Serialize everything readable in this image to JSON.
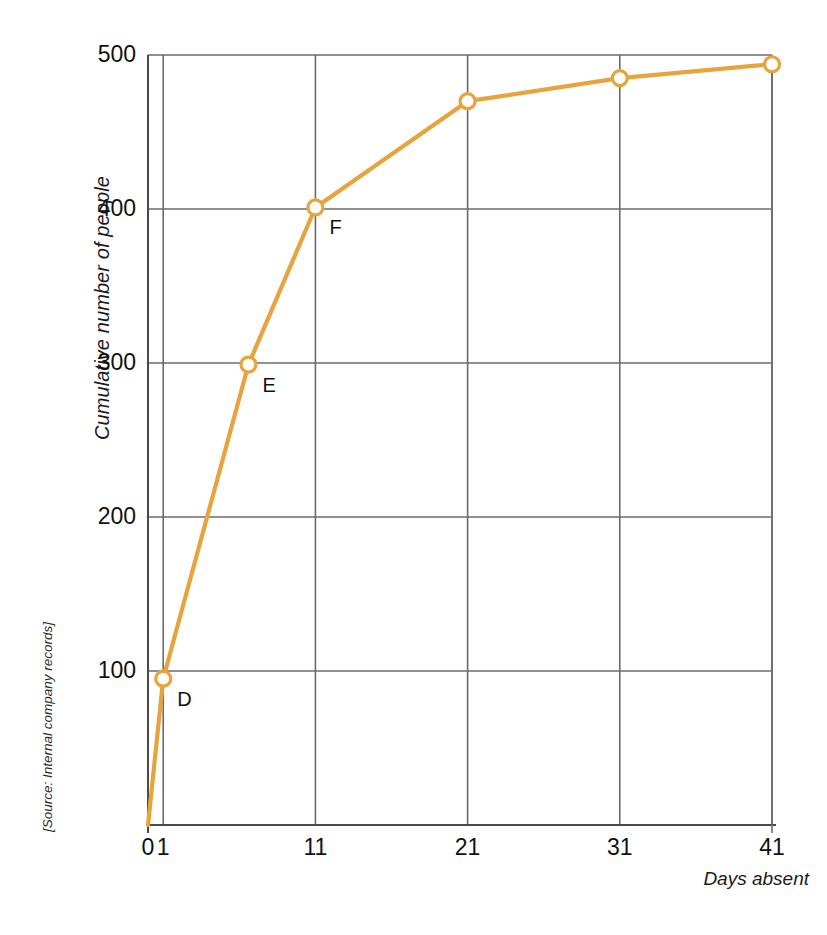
{
  "chart_data": {
    "type": "line",
    "title": "",
    "subtitle": "",
    "xlabel": "Days absent",
    "ylabel": "Cumulative number of people",
    "source_note": "[Source: Internal company records]",
    "xlim": [
      0,
      41
    ],
    "ylim": [
      0,
      500
    ],
    "x_ticks": [
      0,
      1,
      11,
      21,
      31,
      41
    ],
    "x_tick_labels": [
      "0",
      "1",
      "11",
      "21",
      "31",
      "41"
    ],
    "y_ticks": [
      0,
      100,
      200,
      300,
      400,
      500
    ],
    "y_tick_labels": [
      "",
      "100",
      "200",
      "300",
      "400",
      "500"
    ],
    "grid": "both",
    "grid_x_values": [
      0,
      1,
      11,
      21,
      31,
      41
    ],
    "grid_y_values": [
      100,
      200,
      300,
      400,
      500
    ],
    "legend": "none",
    "series": [
      {
        "name": "Cumulative number of people",
        "color": "#E8A33D",
        "marker": "open-circle",
        "points": [
          {
            "x": 0,
            "y": 0,
            "label": "",
            "marker": false
          },
          {
            "x": 1,
            "y": 95,
            "label": "D",
            "marker": true
          },
          {
            "x": 6.6,
            "y": 299,
            "label": "E",
            "marker": true
          },
          {
            "x": 11,
            "y": 401,
            "label": "F",
            "marker": true
          },
          {
            "x": 21,
            "y": 470,
            "label": "",
            "marker": true
          },
          {
            "x": 31,
            "y": 485,
            "label": "",
            "marker": true
          },
          {
            "x": 41,
            "y": 494,
            "label": "",
            "marker": true
          }
        ]
      }
    ],
    "annotations": [
      {
        "text": "D",
        "x": 1,
        "y": 95
      },
      {
        "text": "E",
        "x": 6.6,
        "y": 299
      },
      {
        "text": "F",
        "x": 11,
        "y": 401
      }
    ]
  },
  "colors": {
    "line": "#E8A33D",
    "marker_fill": "#FFFFFF",
    "axis": "#4a4a4a",
    "grid": "#6b6b6b",
    "text": "#1a1a1a",
    "background": "#FFFFFF"
  }
}
